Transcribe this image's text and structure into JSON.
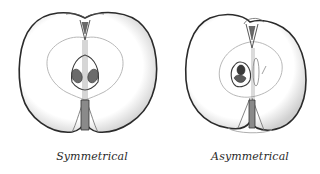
{
  "figures": [
    {
      "id": "symmetrical",
      "caption": "Symmetrical",
      "description": "Cross-section of an apple with symmetrical halves and centered core"
    },
    {
      "id": "asymmetrical",
      "caption": "Asymmetrical",
      "description": "Cross-section of an apple with unequal halves and off-center core"
    }
  ],
  "colors": {
    "outline": "#2b2b2b",
    "core_line": "#9a9a9a",
    "seed": "#5a5a5a",
    "seed_dark": "#3a3a3a",
    "background": "#ffffff"
  }
}
